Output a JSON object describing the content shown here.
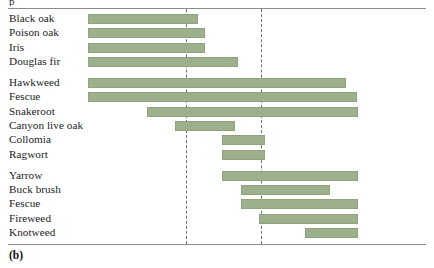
{
  "figure": {
    "caption": "(b)",
    "clipped_top_text": "p",
    "bar_color": "#9cb08c",
    "bar_border_color": "#8fa37e",
    "rule_color": "#8d8d8d",
    "dashed_line_color": "#6f6f6f"
  },
  "chart_data": {
    "type": "bar",
    "orientation": "horizontal",
    "title": "",
    "xlabel": "",
    "ylabel": "",
    "subtitle": "",
    "grid": false,
    "legend": null,
    "axis_visible": false,
    "tick_labels": [],
    "xlim": [
      88,
      366
    ],
    "reference_lines": [
      {
        "name": "reference-line-1",
        "x": 186,
        "style": "dashed"
      },
      {
        "name": "reference-line-2",
        "x": 261,
        "style": "dashed"
      }
    ],
    "note": "Each bar is a floating range bar: 'start' and 'end' are horizontal pixel positions of the bar extent within the 434px-wide figure.",
    "groups": [
      {
        "name": "group-1",
        "items": [
          {
            "label": "Black oak",
            "start": 88,
            "end": 198
          },
          {
            "label": "Poison oak",
            "start": 88,
            "end": 205
          },
          {
            "label": "Iris",
            "start": 88,
            "end": 205
          },
          {
            "label": "Douglas fir",
            "start": 88,
            "end": 238
          }
        ]
      },
      {
        "name": "group-2",
        "items": [
          {
            "label": "Hawkweed",
            "start": 88,
            "end": 346
          },
          {
            "label": "Fescue",
            "start": 88,
            "end": 357
          },
          {
            "label": "Snakeroot",
            "start": 147,
            "end": 358
          },
          {
            "label": "Canyon live oak",
            "start": 175,
            "end": 235
          },
          {
            "label": "Collomia",
            "start": 222,
            "end": 265
          },
          {
            "label": "Ragwort",
            "start": 222,
            "end": 265
          }
        ]
      },
      {
        "name": "group-3",
        "items": [
          {
            "label": "Yarrow",
            "start": 222,
            "end": 358
          },
          {
            "label": "Buck brush",
            "start": 241,
            "end": 330
          },
          {
            "label": "Fescue",
            "start": 241,
            "end": 358
          },
          {
            "label": "Fireweed",
            "start": 259,
            "end": 358
          },
          {
            "label": "Knotweed",
            "start": 305,
            "end": 358
          }
        ]
      }
    ]
  }
}
